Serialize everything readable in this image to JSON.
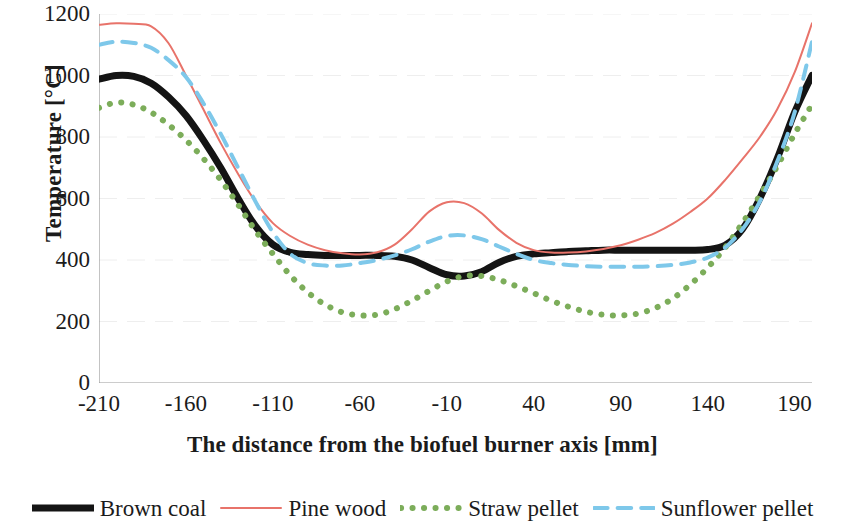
{
  "chart_data": {
    "type": "line",
    "title": "",
    "xlabel": "The distance from the biofuel burner axis [mm]",
    "ylabel": "Temperature  [°C]",
    "xlim": [
      -210,
      200
    ],
    "ylim": [
      0,
      1200
    ],
    "grid": "horizontal-faint",
    "legend_position": "bottom",
    "xticks": [
      -210,
      -160,
      -110,
      -60,
      -10,
      40,
      90,
      140,
      190
    ],
    "xtick_labels": [
      "-210",
      "-160",
      "-110",
      "-60",
      "-10",
      "40",
      "90",
      "140",
      "190"
    ],
    "yticks": [
      0,
      200,
      400,
      600,
      800,
      1000,
      1200
    ],
    "ytick_labels": [
      "0",
      "200",
      "400",
      "600",
      "800",
      "1000",
      "1200"
    ],
    "x": [
      -210,
      -200,
      -190,
      -180,
      -170,
      -160,
      -150,
      -140,
      -130,
      -120,
      -110,
      -100,
      -90,
      -80,
      -70,
      -60,
      -50,
      -40,
      -30,
      -20,
      -10,
      0,
      10,
      20,
      30,
      40,
      50,
      60,
      70,
      80,
      90,
      100,
      110,
      120,
      130,
      140,
      150,
      160,
      170,
      180,
      190,
      200
    ],
    "series": [
      {
        "name": "Brown coal",
        "color": "#141414",
        "style": "solid",
        "width": 7,
        "values": [
          988,
          1000,
          997,
          975,
          930,
          870,
          790,
          700,
          600,
          510,
          450,
          425,
          418,
          415,
          415,
          415,
          415,
          412,
          400,
          375,
          352,
          348,
          362,
          392,
          412,
          420,
          424,
          428,
          430,
          432,
          432,
          432,
          432,
          432,
          432,
          434,
          448,
          500,
          600,
          730,
          880,
          1000
        ]
      },
      {
        "name": "Pine wood",
        "color": "#e8736a",
        "style": "solid",
        "width": 2,
        "values": [
          1165,
          1170,
          1168,
          1160,
          1105,
          1000,
          890,
          780,
          680,
          590,
          520,
          478,
          450,
          432,
          422,
          418,
          425,
          450,
          500,
          558,
          588,
          585,
          552,
          498,
          456,
          432,
          424,
          424,
          428,
          436,
          448,
          466,
          488,
          518,
          556,
          600,
          660,
          728,
          800,
          890,
          1010,
          1170
        ]
      },
      {
        "name": "Straw pellet",
        "color": "#7cad5a",
        "style": "dotted",
        "width": 6,
        "values": [
          895,
          912,
          905,
          880,
          840,
          790,
          730,
          660,
          580,
          495,
          420,
          350,
          295,
          255,
          230,
          220,
          222,
          240,
          268,
          300,
          330,
          348,
          348,
          335,
          315,
          292,
          268,
          248,
          232,
          222,
          220,
          226,
          244,
          275,
          320,
          375,
          440,
          520,
          610,
          705,
          810,
          905
        ]
      },
      {
        "name": "Sunflower pellet",
        "color": "#7ec8ea",
        "style": "dashed",
        "width": 4,
        "values": [
          1100,
          1110,
          1106,
          1090,
          1050,
          995,
          910,
          810,
          700,
          590,
          490,
          420,
          390,
          382,
          382,
          390,
          400,
          415,
          435,
          460,
          478,
          480,
          468,
          444,
          420,
          400,
          390,
          384,
          380,
          378,
          378,
          378,
          380,
          384,
          392,
          408,
          440,
          500,
          590,
          720,
          880,
          1110
        ]
      }
    ]
  },
  "legend": {
    "items": [
      {
        "label": "Brown coal",
        "icon": "thick-black-solid-line-icon"
      },
      {
        "label": "Pine wood",
        "icon": "thin-red-solid-line-icon"
      },
      {
        "label": "Straw pellet",
        "icon": "green-dotted-line-icon"
      },
      {
        "label": "Sunflower pellet",
        "icon": "blue-dashed-line-icon"
      }
    ]
  },
  "colors": {
    "brown_coal": "#141414",
    "pine_wood": "#e8736a",
    "straw_pellet": "#7cad5a",
    "sunflower_pellet": "#7ec8ea",
    "axis": "#9a9a9a",
    "text": "#1b1b1b",
    "gridline": "#eeeeee",
    "background": "#ffffff"
  }
}
